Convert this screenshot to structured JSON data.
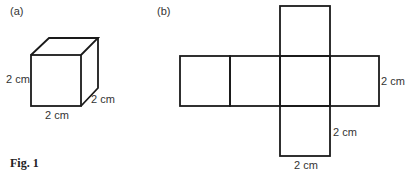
{
  "figure": {
    "caption": "Fig. 1",
    "part_a": {
      "label": "(a)",
      "description": "cube",
      "dimensions": {
        "height": "2 cm",
        "width": "2 cm",
        "depth": "2 cm"
      }
    },
    "part_b": {
      "label": "(b)",
      "description": "net of cube (6 squares)",
      "dimensions": {
        "right_side": "2 cm",
        "bottom_square_side": "2 cm",
        "bottom_square_base": "2 cm"
      }
    }
  },
  "colors": {
    "line": "#1a1a1a",
    "text": "#333333",
    "background": "#ffffff"
  }
}
